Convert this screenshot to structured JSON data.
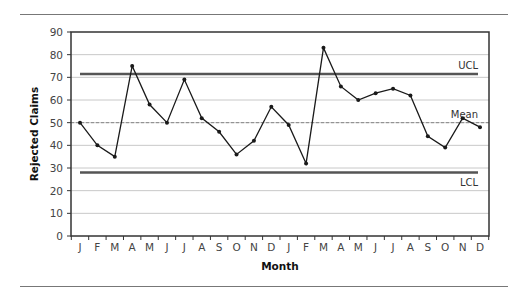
{
  "chart_data": {
    "type": "line",
    "title": "",
    "xlabel": "Month",
    "ylabel": "Rejected Claims",
    "ylim": [
      0,
      90
    ],
    "yticks": [
      0,
      10,
      20,
      30,
      40,
      50,
      60,
      70,
      80,
      90
    ],
    "grid": true,
    "categories": [
      "J",
      "F",
      "M",
      "A",
      "M",
      "J",
      "J",
      "A",
      "S",
      "O",
      "N",
      "D",
      "J",
      "F",
      "M",
      "A",
      "M",
      "J",
      "J",
      "A",
      "S",
      "O",
      "N",
      "D"
    ],
    "series": [
      {
        "name": "Rejected Claims",
        "values": [
          50,
          40,
          35,
          75,
          58,
          50,
          69,
          52,
          46,
          36,
          42,
          57,
          49,
          32,
          83,
          66,
          60,
          63,
          65,
          62,
          44,
          39,
          52,
          48
        ]
      }
    ],
    "reference_lines": [
      {
        "name": "UCL",
        "label": "UCL",
        "value": 71.5,
        "style": "solid"
      },
      {
        "name": "Mean",
        "label": "Mean",
        "value": 50,
        "style": "dashed"
      },
      {
        "name": "LCL",
        "label": "LCL",
        "value": 28,
        "style": "solid"
      }
    ],
    "legend": "none"
  },
  "colors": {
    "line": "#1a1a1a",
    "grid": "#c8c8c8",
    "control_limit": "#555555",
    "mean": "#888888",
    "axis": "#333333"
  }
}
